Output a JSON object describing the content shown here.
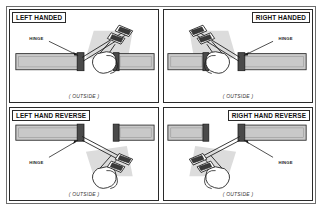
{
  "figure": {
    "kind": "door-handing-diagram",
    "border_color": "#6d6d6d",
    "panel_border_color": "#2a2a2a",
    "door_fill": "#c9c9c9",
    "door_stroke": "#2a2a2a",
    "hinge_cap_fill": "#4a4a4a",
    "shadow_fill": "#d8d8d8"
  },
  "panels": [
    {
      "id": "left-handed",
      "title": "LEFT HANDED",
      "title_align": "left",
      "hinge_label": "HINGE",
      "caption": "( OUTSIDE )"
    },
    {
      "id": "right-handed",
      "title": "RIGHT HANDED",
      "title_align": "right",
      "hinge_label": "HINGE",
      "caption": "( OUTSIDE )"
    },
    {
      "id": "left-hand-reverse",
      "title": "LEFT HAND REVERSE",
      "title_align": "left",
      "hinge_label": "HINGE",
      "caption": "( OUTSIDE )"
    },
    {
      "id": "right-hand-reverse",
      "title": "RIGHT HAND REVERSE",
      "title_align": "right",
      "hinge_label": "HINGE",
      "caption": "( OUTSIDE )"
    }
  ]
}
